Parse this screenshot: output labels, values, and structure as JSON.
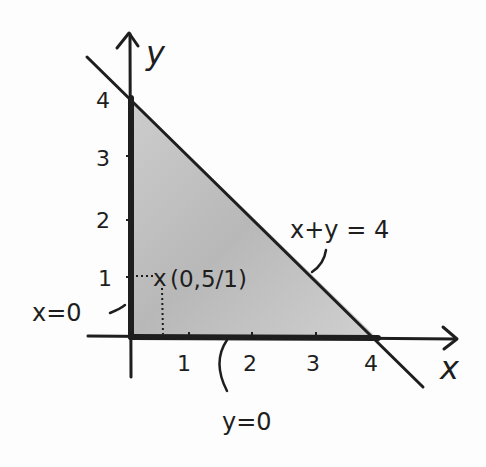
{
  "diagram": {
    "axes": {
      "x_label": "x",
      "y_label": "y",
      "x_ticks": [
        "1",
        "2",
        "3",
        "4"
      ],
      "y_ticks": [
        "1",
        "2",
        "3",
        "4"
      ]
    },
    "lines": {
      "hypotenuse_label": "x+y = 4",
      "x_axis_boundary_label": "y=0",
      "y_axis_boundary_label": "x=0"
    },
    "point": {
      "marker": "x",
      "label": "(0,5/1)"
    },
    "region": {
      "description": "feasible region bounded by x=0, y=0, x+y=4",
      "vertices": [
        [
          0,
          0
        ],
        [
          0,
          4
        ],
        [
          4,
          0
        ]
      ]
    },
    "colors": {
      "ink": "#1e1e1e",
      "shading": "#b4b4b4",
      "paper": "#fdfdfd"
    }
  }
}
